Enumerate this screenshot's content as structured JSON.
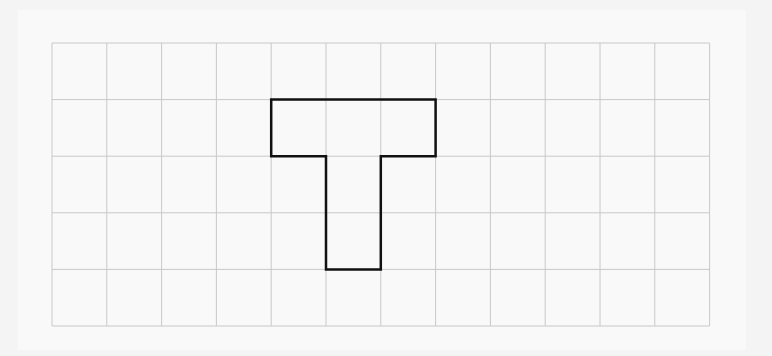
{
  "diagram": {
    "type": "grid-shape",
    "grid": {
      "columns": 12,
      "rows": 5,
      "origin_px": [
        52,
        43
      ],
      "cell_width_px": 54.8,
      "cell_height_px": 56.6,
      "line_color": "#c8c8c8",
      "background_color": "#f9f9f9"
    },
    "shape": {
      "name": "T",
      "stroke_color": "#111111",
      "stroke_width": 2.5,
      "cells": [
        [
          4,
          1
        ],
        [
          5,
          1
        ],
        [
          6,
          1
        ],
        [
          5,
          2
        ],
        [
          5,
          3
        ]
      ],
      "outline_grid_points": [
        [
          4,
          1
        ],
        [
          7,
          1
        ],
        [
          7,
          2
        ],
        [
          6,
          2
        ],
        [
          6,
          4
        ],
        [
          5,
          4
        ],
        [
          5,
          2
        ],
        [
          4,
          2
        ]
      ]
    }
  }
}
